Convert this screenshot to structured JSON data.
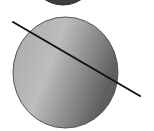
{
  "diagram": {
    "top_circle": {
      "cx": 63,
      "cy": -28,
      "r": 33,
      "fill": "#4a4a4a",
      "stroke": "#333333"
    },
    "main_circle": {
      "cx": 65,
      "cy": 72,
      "r": 53,
      "ry": 56,
      "fill_light": "#b8b8b8",
      "fill_dark": "#6e6e6e",
      "stroke": "#555555"
    },
    "secant_line": {
      "x1": 13,
      "y1": 22,
      "x2": 140,
      "y2": 96,
      "stroke": "#111111",
      "width": 2
    }
  }
}
